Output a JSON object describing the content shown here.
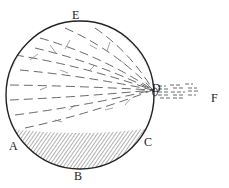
{
  "figure": {
    "kind": "sphere-diagram",
    "ink_color": "#2a2a2a",
    "paper_color": "#ffffff",
    "sphere": {
      "cx": 80,
      "cy": 95,
      "r": 74
    },
    "emission_point": {
      "x": 153,
      "y": 90
    },
    "labels": [
      {
        "id": "E",
        "text": "E",
        "x": 72,
        "y": 9
      },
      {
        "id": "D",
        "text": "D",
        "x": 152,
        "y": 82
      },
      {
        "id": "F",
        "text": "F",
        "x": 211,
        "y": 92
      },
      {
        "id": "A",
        "text": "A",
        "x": 9,
        "y": 140
      },
      {
        "id": "C",
        "text": "C",
        "x": 144,
        "y": 136
      },
      {
        "id": "B",
        "text": "B",
        "x": 74,
        "y": 170
      }
    ]
  }
}
